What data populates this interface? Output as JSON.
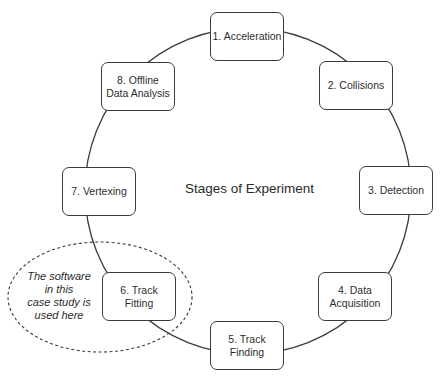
{
  "diagram": {
    "title": "Stages of Experiment",
    "stages": [
      {
        "label": "1. Acceleration"
      },
      {
        "label": "2. Collisions"
      },
      {
        "label": "3. Detection"
      },
      {
        "label": "4. Data\nAcquisition"
      },
      {
        "label": "5. Track\nFinding"
      },
      {
        "label": "6. Track\nFitting"
      },
      {
        "label": "7. Vertexing"
      },
      {
        "label": "8. Offline\nData Analysis"
      }
    ],
    "annotation": "The software\nin this\ncase study is\nused here",
    "colors": {
      "stroke": "#3a3a3a",
      "background": "#ffffff",
      "text": "#2a2a2a"
    }
  }
}
